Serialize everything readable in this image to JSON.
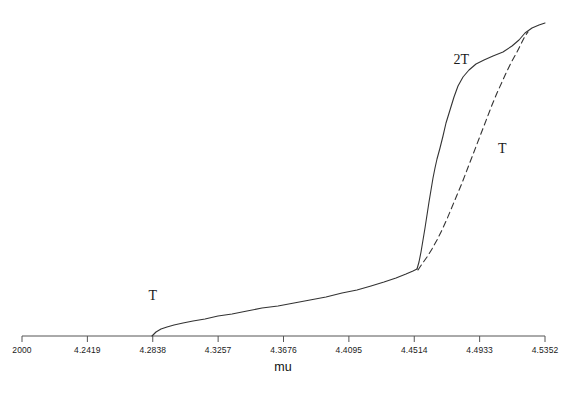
{
  "chart_data": {
    "type": "line",
    "title": "",
    "xlabel": "mu",
    "ylabel": "",
    "grid": false,
    "legend_position": "inline-annotations",
    "xlim": [
      4.2,
      4.5352
    ],
    "xticks": [
      4.2,
      4.2419,
      4.2838,
      4.3257,
      4.3676,
      4.4095,
      4.4514,
      4.4933,
      4.5352
    ],
    "xticklabels": [
      "2000",
      "4.2419",
      "4.2838",
      "4.3257",
      "4.3676",
      "4.4095",
      "4.4514",
      "4.4933",
      "4.5352"
    ],
    "xticklabel_note": "first tick label is clipped by the left image edge; full value is 4.2000",
    "yaxis_visible": false,
    "yticks": [],
    "annotations": [
      {
        "text": "T",
        "x": 4.2838,
        "y_px": 296,
        "style": "serif",
        "describes": "lower period-T branch"
      },
      {
        "text": "2T",
        "x": 4.4816,
        "y_px": 60,
        "style": "serif",
        "describes": "upper solid period-2T branch"
      },
      {
        "text": "T",
        "x": 4.5079,
        "y_px": 149,
        "style": "serif",
        "describes": "dashed period-T branch"
      }
    ],
    "series": [
      {
        "name": "T",
        "label": "T",
        "linestyle": "solid",
        "color": "#333333",
        "description": "lower shallow branch rising from the axis to the knee",
        "points_px": [
          [
            152,
            336
          ],
          [
            156,
            332
          ],
          [
            161,
            329
          ],
          [
            167,
            327
          ],
          [
            174,
            325
          ],
          [
            183,
            323
          ],
          [
            193,
            321
          ],
          [
            205,
            319
          ],
          [
            218,
            316
          ],
          [
            232,
            314
          ],
          [
            247,
            311
          ],
          [
            262,
            308
          ],
          [
            278,
            306
          ],
          [
            294,
            303
          ],
          [
            310,
            300
          ],
          [
            326,
            297
          ],
          [
            342,
            293
          ],
          [
            357,
            290
          ],
          [
            371,
            286
          ],
          [
            384,
            282
          ],
          [
            396,
            278
          ],
          [
            406,
            274
          ],
          [
            413,
            271
          ],
          [
            417,
            269
          ]
        ]
      },
      {
        "name": "2T",
        "label": "2T",
        "linestyle": "solid",
        "color": "#333333",
        "description": "upper steep solid branch from the knee to the merge point",
        "points_px": [
          [
            417,
            269
          ],
          [
            419,
            262
          ],
          [
            421,
            252
          ],
          [
            423,
            240
          ],
          [
            425,
            228
          ],
          [
            427,
            215
          ],
          [
            429,
            202
          ],
          [
            431,
            190
          ],
          [
            433,
            178
          ],
          [
            435,
            168
          ],
          [
            437,
            159
          ],
          [
            440,
            148
          ],
          [
            443,
            136
          ],
          [
            446,
            123
          ],
          [
            450,
            110
          ],
          [
            454,
            97
          ],
          [
            458,
            86
          ],
          [
            463,
            77
          ],
          [
            469,
            70
          ],
          [
            476,
            64
          ],
          [
            484,
            60
          ],
          [
            493,
            56
          ],
          [
            503,
            52
          ],
          [
            512,
            46
          ],
          [
            519,
            40
          ],
          [
            525,
            33
          ],
          [
            532,
            28
          ],
          [
            539,
            25
          ],
          [
            545,
            23
          ]
        ]
      },
      {
        "name": "T-dashed",
        "label": "T",
        "linestyle": "dashed",
        "dash_pattern": [
          6,
          4
        ],
        "color": "#333333",
        "description": "dashed unstable period-T branch splitting at the knee and rejoining near the top",
        "points_px": [
          [
            418,
            270
          ],
          [
            422,
            264
          ],
          [
            427,
            257
          ],
          [
            432,
            249
          ],
          [
            437,
            240
          ],
          [
            442,
            230
          ],
          [
            447,
            219
          ],
          [
            452,
            207
          ],
          [
            457,
            195
          ],
          [
            462,
            183
          ],
          [
            467,
            170
          ],
          [
            472,
            157
          ],
          [
            477,
            144
          ],
          [
            482,
            131
          ],
          [
            487,
            118
          ],
          [
            492,
            105
          ],
          [
            497,
            93
          ],
          [
            502,
            82
          ],
          [
            507,
            71
          ],
          [
            512,
            61
          ],
          [
            517,
            52
          ],
          [
            521,
            44
          ],
          [
            525,
            36
          ],
          [
            528,
            32
          ]
        ]
      }
    ]
  },
  "axis": {
    "line_color": "#555555",
    "x_start_px": 22,
    "x_end_px": 545,
    "y_px": 336,
    "tick_length_px": 6
  }
}
